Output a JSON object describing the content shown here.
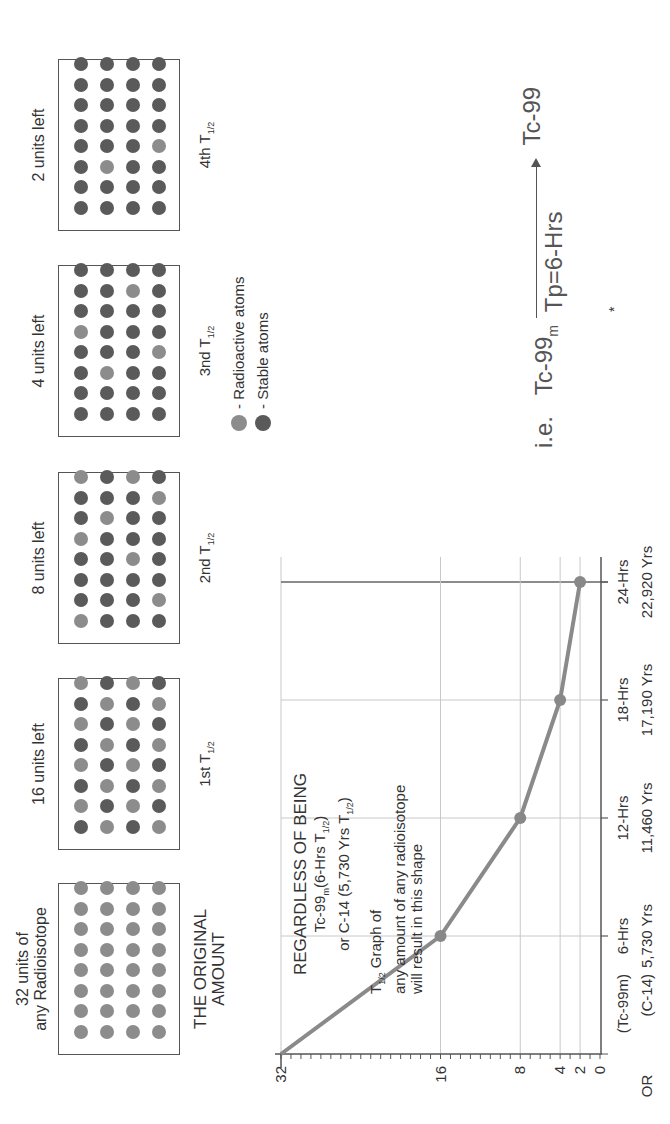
{
  "figure": {
    "orientation": "rotated-90-ccw",
    "boxes": [
      {
        "label_lines": [
          "32 units of",
          "any Radioisotope"
        ],
        "caption_lines": [
          "THE ORIGINAL",
          "AMOUNT"
        ],
        "caption_type": "original",
        "grid": [
          "RRRRRRRR",
          "RRRRRRRR",
          "RRRRRRRR",
          "RRRRRRRR"
        ]
      },
      {
        "label_lines": [
          "16 units left"
        ],
        "caption_base": "1st T",
        "caption_sub": "1/2",
        "grid": [
          "SRSRSRSR",
          "RSRSRSRS",
          "SRSRSRSR",
          "RSRSRSRS"
        ]
      },
      {
        "label_lines": [
          "8 units left"
        ],
        "caption_base": "2nd T",
        "caption_sub": "1/2",
        "grid": [
          "RSSSRSSR",
          "SSSSSRSS",
          "SSSRSSSR",
          "SRSSSSRS"
        ]
      },
      {
        "label_lines": [
          "4 units left"
        ],
        "caption_base": "3nd T",
        "caption_sub": "1/2",
        "grid": [
          "SSSSRSSS",
          "SSRSSSSS",
          "SSSSSSRS",
          "SSSRSSSS"
        ]
      },
      {
        "label_lines": [
          "2 units left"
        ],
        "caption_base": "4th T",
        "caption_sub": "1/2",
        "grid": [
          "SSSSSSSS",
          "SSRSSSSS",
          "SSSSSSSS",
          "SSSRSSSS"
        ]
      }
    ],
    "legend": {
      "radioactive": "- Radioactive atoms",
      "stable": "- Stable atoms"
    },
    "colors": {
      "radioactive": "#8c8c8c",
      "stable": "#5a5a5a",
      "curve": "#8a8a8a",
      "grid": "#c8c8c8",
      "axis": "#555555"
    },
    "note": {
      "title": "REGARDLESS OF BEING",
      "line2_a": "Tc-99",
      "line2_sub": "m",
      "line2_b": "(6-Hrs T",
      "line2_sub2": "1/2",
      "line2_c": ")",
      "line3_a": "or C-14 (5,730 Yrs T",
      "line3_sub": "1/2",
      "line3_c": ")",
      "line4_a": "T",
      "line4_sub": "1/2",
      "line4_b": " Graph of",
      "line5": "any amount of any  radioisotope",
      "line6": "will  result in this shape"
    },
    "equation": {
      "prefix": "i.e.",
      "reactant": "Tc-99",
      "reactant_sub": "m",
      "condition": "Tp=6-Hrs",
      "product": "Tc-99"
    },
    "asterisk": "*"
  },
  "chart_data": {
    "type": "line",
    "title": "",
    "xlabel": "Time (Tc-99m hours / C-14 years)",
    "ylabel": "Units of radioisotope remaining",
    "x": [
      0,
      6,
      12,
      18,
      24
    ],
    "x_tick_labels_tc99m": [
      "",
      "6-Hrs",
      "12-Hrs",
      "18-Hrs",
      "24-Hrs"
    ],
    "x_tick_labels_c14": [
      "",
      "5,730 Yrs",
      "11,460 Yrs",
      "17,190 Yrs",
      "22,920 Yrs"
    ],
    "x_row_prefixes": [
      "(Tc-99m)",
      "(C-14)"
    ],
    "or_label": "OR",
    "series": [
      {
        "name": "Remaining units",
        "values": [
          32,
          16,
          8,
          4,
          2
        ]
      }
    ],
    "y_ticks": [
      32,
      16,
      8,
      4,
      2,
      0
    ],
    "ylim": [
      0,
      32
    ],
    "xlim": [
      0,
      24
    ],
    "grid": true
  }
}
